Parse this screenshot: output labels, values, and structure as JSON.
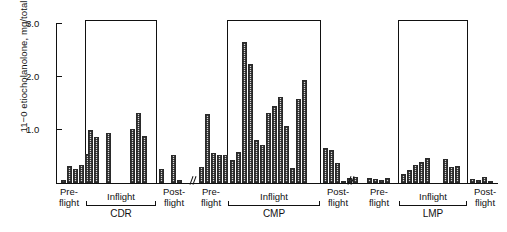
{
  "chart_data": {
    "type": "bar",
    "title": "",
    "xlabel": "",
    "ylabel": "11−0 etiocholanolone, mg/total volume",
    "ylim": [
      0,
      3.0
    ],
    "yticks": [
      0,
      1.0,
      2.0,
      3.0
    ],
    "ytick_labels": [
      "",
      "1.0",
      "2.0",
      "3.0"
    ],
    "grid": false,
    "legend": "none",
    "axis_breaks": 2,
    "groups": [
      {
        "name": "CDR",
        "phases": [
          {
            "label_line1": "Pre-",
            "label_line2": "flight",
            "boxed": false,
            "values": [
              0.06,
              0.33,
              0.26,
              0.34,
              0.55
            ]
          },
          {
            "label_line1": "Inflight",
            "label_line2": "",
            "boxed": true,
            "values": [
              1.0,
              0.86,
              0.0,
              0.95,
              0.0,
              0.0,
              0.0,
              1.02,
              1.33,
              0.88
            ]
          },
          {
            "label_line1": "Post-",
            "label_line2": "flight",
            "boxed": false,
            "values": [
              0.26,
              0.0,
              0.53,
              0.06
            ]
          }
        ]
      },
      {
        "name": "CMP",
        "phases": [
          {
            "label_line1": "Pre-",
            "label_line2": "flight",
            "boxed": false,
            "values": [
              0.3,
              1.3,
              0.56,
              0.52,
              0.52
            ]
          },
          {
            "label_line1": "Inflight",
            "label_line2": "",
            "boxed": true,
            "values": [
              0.44,
              0.58,
              2.67,
              2.25,
              0.82,
              0.72,
              1.32,
              1.45,
              1.62,
              1.08,
              0.28,
              1.58,
              1.95
            ]
          },
          {
            "label_line1": "Post-",
            "label_line2": "flight",
            "boxed": false,
            "values": [
              0.66,
              0.62,
              0.38,
              0.04,
              0.1,
              0.12
            ]
          }
        ]
      },
      {
        "name": "LMP",
        "phases": [
          {
            "label_line1": "Pre-",
            "label_line2": "flight",
            "boxed": false,
            "values": [
              0.09,
              0.07,
              0.05,
              0.1
            ]
          },
          {
            "label_line1": "Inflight",
            "label_line2": "",
            "boxed": true,
            "values": [
              0.18,
              0.25,
              0.34,
              0.4,
              0.48,
              0.0,
              0.0,
              0.46,
              0.3,
              0.33
            ]
          },
          {
            "label_line1": "Post-",
            "label_line2": "flight",
            "boxed": false,
            "values": [
              0.07,
              0.06,
              0.12,
              0.04
            ]
          }
        ]
      }
    ]
  },
  "axis": {
    "ylabel": "11−0 etiocholanolone, mg/total volume",
    "tick_3": "3.0",
    "tick_2": "2.0",
    "tick_1": "1.0"
  },
  "labels": {
    "pre_l1": "Pre-",
    "pre_l2": "flight",
    "inflight": "Inflight",
    "post_l1": "Post-",
    "post_l2": "flight",
    "cdr": "CDR",
    "cmp": "CMP",
    "lmp": "LMP"
  }
}
